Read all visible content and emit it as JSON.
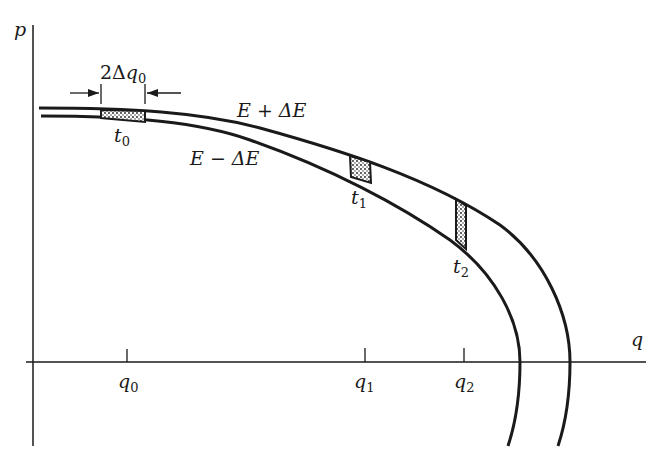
{
  "diagram": {
    "axes": {
      "vertical_label": "p",
      "horizontal_label": "q",
      "ticks": [
        {
          "label": "q",
          "sub": "0"
        },
        {
          "label": "q",
          "sub": "1"
        },
        {
          "label": "q",
          "sub": "2"
        }
      ]
    },
    "curves": {
      "outer_label": "E + ΔE",
      "inner_label": "E − ΔE"
    },
    "width_marker": {
      "prefix": "2Δ",
      "var": "q",
      "sub": "0"
    },
    "times": [
      {
        "label": "t",
        "sub": "0"
      },
      {
        "label": "t",
        "sub": "1"
      },
      {
        "label": "t",
        "sub": "2"
      }
    ],
    "colors": {
      "ink": "#1a1a1a",
      "background": "#ffffff"
    }
  }
}
